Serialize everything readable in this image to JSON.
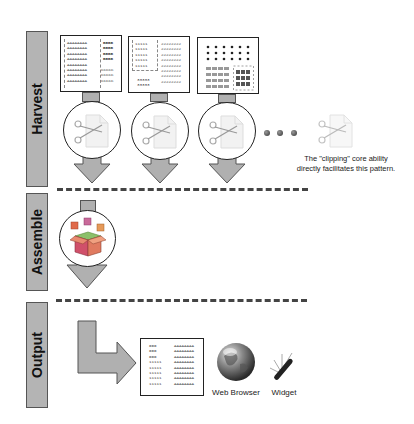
{
  "title_fragment": "...",
  "phases": [
    {
      "id": "harvest",
      "label": "Harvest"
    },
    {
      "id": "assemble",
      "label": "Assemble"
    },
    {
      "id": "output",
      "label": "Output"
    }
  ],
  "harvest": {
    "sources": [
      {
        "name": "source-document-1",
        "lines_a": [
          "AAAAAAAA",
          "AAAAAAAA",
          "AAAAAAAA",
          "AAAAAAAA",
          "AAAAAAAA",
          "AAAAAAAA",
          "AAAAAAAA",
          "AAAAAAAA"
        ],
        "lines_b": [
          "BBBB",
          "BBBB",
          "BBBB",
          "BBBB"
        ],
        "lines_c": [
          "CCCCC",
          "CCCCC",
          "CCCCC"
        ]
      },
      {
        "name": "source-document-2",
        "lines_a": [
          "11111",
          "11111",
          "11111",
          "11111",
          "11111"
        ],
        "lines_b": [
          "22222222",
          "22222222",
          "22222222",
          "22222222",
          "22222222",
          "22222222",
          "22222222",
          "22222222"
        ],
        "lines_c": [
          "33333",
          "33333"
        ]
      },
      {
        "name": "source-document-3"
      }
    ],
    "ellipsis": "• • •",
    "caption_line1": "The \"clipping\" core ability",
    "caption_line2": "directly facilitates this pattern."
  },
  "output": {
    "document": {
      "lines_left": [
        "XXX",
        "XXX",
        "XXX",
        "11111",
        "11111",
        "11111",
        "11111",
        "11111"
      ],
      "lines_right": [
        "AAAAAAAA",
        "AAAAAAAA",
        "AAAAAAAA",
        "AAAAAAAA",
        "AAAAAAAA",
        "AAAAAAAA",
        "AAAAAAAA",
        "AAAAAAAA"
      ]
    },
    "targets": [
      {
        "label": "Web Browser",
        "icon": "globe-icon"
      },
      {
        "label": "Widget",
        "icon": "swiss-army-knife-icon"
      }
    ]
  },
  "colors": {
    "phase_bar": "#b4b4b4",
    "arrow_fill": "#b0b0b0",
    "outline": "#222222",
    "dash": "#444444"
  }
}
